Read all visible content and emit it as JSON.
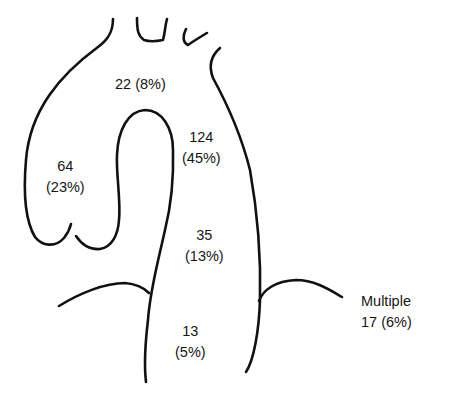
{
  "diagram": {
    "stroke_color": "#111111",
    "background": "#ffffff",
    "regions": [
      {
        "id": "aortic-arch",
        "count": "22",
        "percent": "(8%)",
        "text": "22 (8%)"
      },
      {
        "id": "ascending-aorta",
        "count": "64",
        "percent": "(23%)"
      },
      {
        "id": "proximal-descending-aorta",
        "count": "124",
        "percent": "(45%)"
      },
      {
        "id": "mid-descending-thoracic-aorta",
        "count": "35",
        "percent": "(13%)"
      },
      {
        "id": "distal-descending-aorta",
        "count": "13",
        "percent": "(5%)"
      },
      {
        "id": "multiple",
        "label": "Multiple",
        "value": "17 (6%)"
      }
    ]
  }
}
